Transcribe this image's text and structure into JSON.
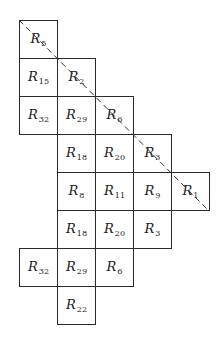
{
  "diagram": {
    "type": "cell-grid",
    "cell_size_px": 38,
    "origin_px": [
      19,
      20
    ],
    "label_prefix": "R",
    "cells": [
      {
        "row": 0,
        "col": 0,
        "prefix": "R",
        "sub": "5"
      },
      {
        "row": 1,
        "col": 0,
        "prefix": "R",
        "sub": "15"
      },
      {
        "row": 1,
        "col": 1,
        "prefix": "R",
        "sub": "2"
      },
      {
        "row": 2,
        "col": 0,
        "prefix": "R",
        "sub": "32"
      },
      {
        "row": 2,
        "col": 1,
        "prefix": "R",
        "sub": "29"
      },
      {
        "row": 2,
        "col": 2,
        "prefix": "R",
        "sub": "6"
      },
      {
        "row": 3,
        "col": 1,
        "prefix": "R",
        "sub": "18"
      },
      {
        "row": 3,
        "col": 2,
        "prefix": "R",
        "sub": "20"
      },
      {
        "row": 3,
        "col": 3,
        "prefix": "R",
        "sub": "3"
      },
      {
        "row": 4,
        "col": 1,
        "prefix": "R",
        "sub": "8"
      },
      {
        "row": 4,
        "col": 2,
        "prefix": "R",
        "sub": "11"
      },
      {
        "row": 4,
        "col": 3,
        "prefix": "R",
        "sub": "9"
      },
      {
        "row": 4,
        "col": 4,
        "prefix": "R",
        "sub": "1"
      },
      {
        "row": 5,
        "col": 1,
        "prefix": "R",
        "sub": "18"
      },
      {
        "row": 5,
        "col": 2,
        "prefix": "R",
        "sub": "20"
      },
      {
        "row": 5,
        "col": 3,
        "prefix": "R",
        "sub": "3"
      },
      {
        "row": 6,
        "col": 0,
        "prefix": "R",
        "sub": "32"
      },
      {
        "row": 6,
        "col": 1,
        "prefix": "R",
        "sub": "29"
      },
      {
        "row": 6,
        "col": 2,
        "prefix": "R",
        "sub": "6"
      },
      {
        "row": 7,
        "col": 1,
        "prefix": "R",
        "sub": "22"
      }
    ],
    "diagonal": {
      "style": "dashed",
      "from": [
        19,
        20
      ],
      "to": [
        208,
        210
      ],
      "color": "#333333"
    },
    "colors": {
      "line": "#2a2a2a",
      "text": "#222222",
      "background": "#ffffff"
    }
  }
}
